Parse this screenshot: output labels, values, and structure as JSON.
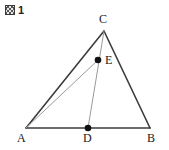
{
  "figure": {
    "caption": "1",
    "caption_icon": "figure-kanji-glyph",
    "type": "triangle-geometry-diagram",
    "background_color": "#ffffff",
    "stroke_color_primary": "#3c3c3c",
    "stroke_color_secondary": "#9a9a9a",
    "point_color": "#111111",
    "points": [
      {
        "id": "A",
        "label": "A",
        "x": 26,
        "y": 128,
        "marked": false
      },
      {
        "id": "B",
        "label": "B",
        "x": 150,
        "y": 128,
        "marked": false
      },
      {
        "id": "C",
        "label": "C",
        "x": 104,
        "y": 31,
        "marked": false
      },
      {
        "id": "D",
        "label": "D",
        "x": 88,
        "y": 128,
        "marked": true
      },
      {
        "id": "E",
        "label": "E",
        "x": 98,
        "y": 60,
        "marked": true
      }
    ],
    "segments": [
      {
        "id": "AB",
        "from": "A",
        "to": "B",
        "weight": "heavy"
      },
      {
        "id": "AC",
        "from": "A",
        "to": "C",
        "weight": "heavy"
      },
      {
        "id": "CB",
        "from": "C",
        "to": "B",
        "weight": "heavy"
      },
      {
        "id": "CD",
        "from": "C",
        "to": "D",
        "weight": "light"
      },
      {
        "id": "AE",
        "from": "A",
        "to": "E",
        "weight": "light"
      }
    ]
  }
}
